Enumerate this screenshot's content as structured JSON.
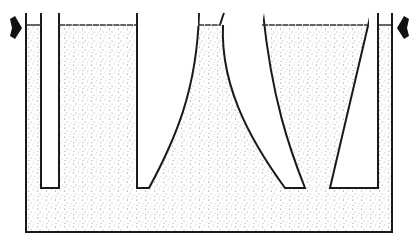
{
  "diagram": {
    "colors": {
      "background": "#ffffff",
      "stroke": "#1a1a1a",
      "stipple": "#8a8a8a"
    },
    "tank": {
      "left_x": 26,
      "right_x": 392,
      "top_y": 13,
      "bottom_y": 232,
      "liquid_level_y": 25
    },
    "arrows": [
      {
        "id": "left-arrow",
        "direction": "right",
        "x": 8,
        "y": 28
      },
      {
        "id": "right-arrow",
        "direction": "left",
        "x": 410,
        "y": 28
      }
    ],
    "inserts": [
      {
        "id": "left-probe",
        "shape": "rectangle"
      },
      {
        "id": "curved-cylinder",
        "shape": "concave-curved"
      },
      {
        "id": "curved-wedge",
        "shape": "curved-wedge"
      },
      {
        "id": "straight-wedge",
        "shape": "trapezoid"
      },
      {
        "id": "right-probe",
        "shape": "rectangle"
      }
    ]
  }
}
